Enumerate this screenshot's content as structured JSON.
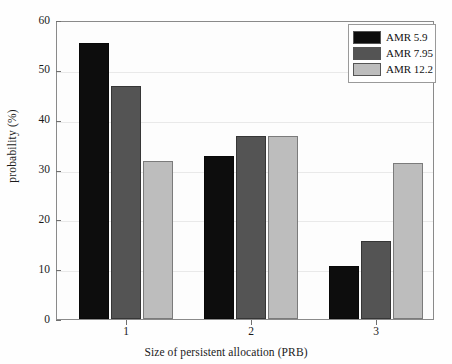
{
  "chart_data": {
    "type": "bar",
    "title": "",
    "xlabel": "Size of persistent allocation (PRB)",
    "ylabel": "probability (%)",
    "categories": [
      "1",
      "2",
      "3"
    ],
    "series": [
      {
        "name": "AMR 5.9",
        "color": "#0d0d0d",
        "values": [
          55.8,
          33.0,
          10.8
        ]
      },
      {
        "name": "AMR 7.95",
        "color": "#545454",
        "values": [
          47.0,
          37.0,
          15.8
        ]
      },
      {
        "name": "AMR 12.2",
        "color": "#bdbdbd",
        "values": [
          32.0,
          37.0,
          31.5
        ]
      }
    ],
    "ylim": [
      0,
      60
    ],
    "yticks": [
      0,
      10,
      20,
      30,
      40,
      50,
      60
    ],
    "ytick_labels": [
      "0",
      "10",
      "20",
      "30",
      "40",
      "50",
      "60"
    ],
    "xtick_labels": [
      "1",
      "2",
      "3"
    ],
    "grid": true,
    "grid_axis": "y",
    "legend_position": "top-right",
    "legend_entries": [
      "AMR 5.9",
      "AMR 7.95",
      "AMR 12.2"
    ]
  }
}
